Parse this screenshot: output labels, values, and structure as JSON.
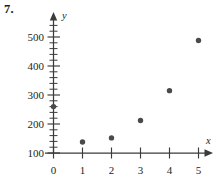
{
  "exercise": {
    "number_label": "7."
  },
  "chart_data": {
    "type": "scatter",
    "title": "",
    "xlabel": "x",
    "ylabel": "y",
    "grid": false,
    "legend": null,
    "xlim": [
      0,
      5
    ],
    "ylim": [
      100,
      520
    ],
    "x_ticks": [
      0,
      1,
      2,
      3,
      4,
      5
    ],
    "x_tick_labels": [
      "0",
      "1",
      "2",
      "3",
      "4",
      "5"
    ],
    "y_ticks": [
      100,
      200,
      300,
      400,
      500
    ],
    "y_tick_labels": [
      "100",
      "200",
      "300",
      "400",
      "500"
    ],
    "y_minor_tick_step": 20,
    "axis_arrows": {
      "x": "right",
      "y": "up"
    },
    "points": [
      {
        "x": 0,
        "y": 260
      },
      {
        "x": 1,
        "y": 138
      },
      {
        "x": 2,
        "y": 152
      },
      {
        "x": 3,
        "y": 212
      },
      {
        "x": 4,
        "y": 315
      },
      {
        "x": 5,
        "y": 488
      }
    ],
    "marker": "filled-circle",
    "marker_color": "#4a4a4a"
  }
}
